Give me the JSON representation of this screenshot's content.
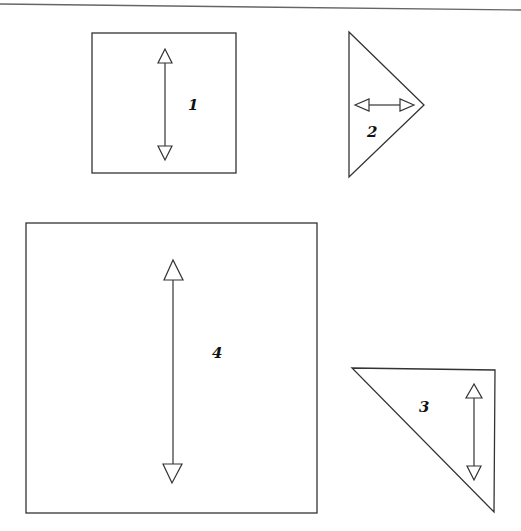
{
  "diagram": {
    "shapes": [
      {
        "id": 1,
        "type": "square",
        "label": "1",
        "arrow": "vertical"
      },
      {
        "id": 2,
        "type": "triangle",
        "label": "2",
        "arrow": "horizontal"
      },
      {
        "id": 3,
        "type": "triangle",
        "label": "3",
        "arrow": "vertical"
      },
      {
        "id": 4,
        "type": "square",
        "label": "4",
        "arrow": "vertical"
      }
    ]
  },
  "colors": {
    "stroke": "#333333",
    "background": "#ffffff"
  }
}
